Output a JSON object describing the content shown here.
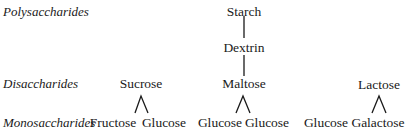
{
  "levels": {
    "polysaccharides": "Polysaccharides",
    "disaccharides": "Disaccharides",
    "monosaccharides": "Monosaccharides"
  },
  "nodes": {
    "starch": "Starch",
    "dextrin": "Dextrin",
    "maltose": "Maltose",
    "sucrose": "Sucrose",
    "lactose": "Lactose",
    "sucrose_children": [
      "Fructose",
      "Glucose"
    ],
    "maltose_children": [
      "Glucose",
      "Glucose"
    ],
    "lactose_children": [
      "Glucose",
      "Galactose"
    ]
  },
  "colors": {
    "text": "#1a1a1a",
    "line": "#1a1a1a",
    "background": "#ffffff"
  }
}
